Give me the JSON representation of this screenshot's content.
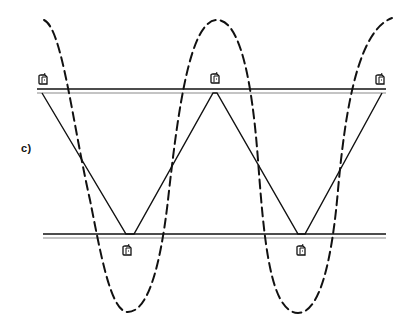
{
  "figure": {
    "panel_label": "c)",
    "colors": {
      "ink": "#111111",
      "rail_light": "#8a8a8a",
      "background": "#ffffff"
    },
    "rails": [
      {
        "name": "upper-rail",
        "x1": 37,
        "x2": 386,
        "y_top": 89,
        "y_bottom": 93
      },
      {
        "name": "lower-rail",
        "x1": 43,
        "x2": 386,
        "y_top": 234,
        "y_bottom": 238
      }
    ],
    "zigzag_points": [
      [
        42,
        93
      ],
      [
        126,
        234
      ],
      [
        134,
        234
      ],
      [
        213,
        93
      ],
      [
        217,
        93
      ],
      [
        298,
        234
      ],
      [
        305,
        234
      ],
      [
        382,
        93
      ]
    ],
    "wave": {
      "style": "dashed",
      "path": "M 44 20 C 62 28, 72 120, 90 200 C 100 250, 110 310, 127 312 C 147 313, 160 270, 168 200 C 178 110, 190 20, 217 20 C 240 20, 252 80, 258 160 C 264 240, 270 312, 298 313 C 320 313, 332 260, 338 190 C 346 100, 360 30, 392 18"
    },
    "markers": [
      {
        "name": "marker-upper-left",
        "x": 38,
        "y": 73
      },
      {
        "name": "marker-upper-middle",
        "x": 210,
        "y": 72
      },
      {
        "name": "marker-upper-right",
        "x": 375,
        "y": 73
      },
      {
        "name": "marker-lower-left",
        "x": 122,
        "y": 244
      },
      {
        "name": "marker-lower-right",
        "x": 296,
        "y": 244
      }
    ]
  }
}
